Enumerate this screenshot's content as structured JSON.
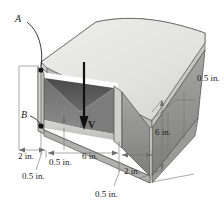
{
  "figure": {
    "type": "engineering-diagram",
    "points": [
      {
        "id": "A",
        "label": "A"
      },
      {
        "id": "B",
        "label": "B"
      }
    ],
    "force": {
      "label": "V",
      "direction": "downward"
    },
    "dimensions": [
      {
        "id": "top-plate-thickness",
        "label": "0.5 in."
      },
      {
        "id": "left-flange-width",
        "label": "2 in."
      },
      {
        "id": "left-web-thickness",
        "label": "0.5 in."
      },
      {
        "id": "inner-width",
        "label": "6 in."
      },
      {
        "id": "right-web-thickness",
        "label": "2 in."
      },
      {
        "id": "bottom-plate-thickness",
        "label": "0.5 in."
      },
      {
        "id": "beam-depth",
        "label": "6 in."
      }
    ],
    "colors": {
      "top_face": "#e3e3e1",
      "side_face": "#9a9a99",
      "inner_dark": "#5c5c5c",
      "inner_light": "#c9c9c7",
      "outline": "#3a3a3a",
      "dim_line": "#6f6f6f",
      "text": "#1a1a1a"
    }
  }
}
